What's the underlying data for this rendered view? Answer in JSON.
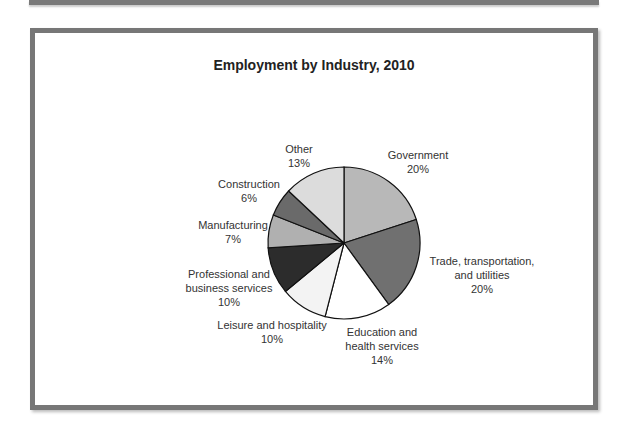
{
  "chart_data": {
    "type": "pie",
    "title": "Employment by Industry, 2010",
    "start_angle": "12 o'clock",
    "direction": "clockwise",
    "slices": [
      {
        "label": "Government",
        "value": 20,
        "pct_label": "20%",
        "color": "#b8b8b8"
      },
      {
        "label": "Trade, transportation, and utilities",
        "value": 20,
        "pct_label": "20%",
        "color": "#707070"
      },
      {
        "label": "Education and health services",
        "value": 14,
        "pct_label": "14%",
        "color": "#ffffff"
      },
      {
        "label": "Leisure and hospitality",
        "value": 10,
        "pct_label": "10%",
        "color": "#f3f3f3"
      },
      {
        "label": "Professional and business services",
        "value": 10,
        "pct_label": "10%",
        "color": "#2c2c2c"
      },
      {
        "label": "Manufacturing",
        "value": 7,
        "pct_label": "7%",
        "color": "#b0b0b0"
      },
      {
        "label": "Construction",
        "value": 6,
        "pct_label": "6%",
        "color": "#6a6a6a"
      },
      {
        "label": "Other",
        "value": 13,
        "pct_label": "13%",
        "color": "#dcdcdc"
      }
    ]
  },
  "labels": [
    {
      "lines": [
        "Government",
        "20%"
      ],
      "x": 418,
      "y": 148
    },
    {
      "lines": [
        "Trade, transportation,",
        "and utilities",
        "20%"
      ],
      "x": 482,
      "y": 254
    },
    {
      "lines": [
        "Education and",
        "health services",
        "14%"
      ],
      "x": 382,
      "y": 325
    },
    {
      "lines": [
        "Leisure and hospitality",
        "10%"
      ],
      "x": 272,
      "y": 318
    },
    {
      "lines": [
        "Professional and",
        "business services",
        "10%"
      ],
      "x": 229,
      "y": 267
    },
    {
      "lines": [
        "Manufacturing",
        "7%"
      ],
      "x": 233,
      "y": 218
    },
    {
      "lines": [
        "Construction",
        "6%"
      ],
      "x": 249,
      "y": 177
    },
    {
      "lines": [
        "Other",
        "13%"
      ],
      "x": 299,
      "y": 142
    }
  ]
}
